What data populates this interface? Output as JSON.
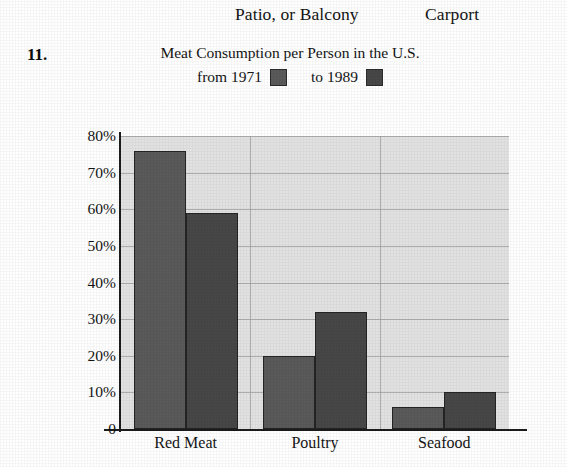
{
  "header": {
    "fragment_left": "Patio, or Balcony",
    "fragment_right": "Carport"
  },
  "problem": {
    "number": "11."
  },
  "chart_data": {
    "type": "bar",
    "title_line1": "Meat Consumption per Person in the U.S.",
    "title_line2_prefix": "from 1971",
    "title_line2_suffix": "to 1989",
    "categories": [
      "Red Meat",
      "Poultry",
      "Seafood"
    ],
    "series": [
      {
        "name": "from 1971",
        "values": [
          76,
          59,
          20
        ],
        "color": "#5a5a5a"
      },
      {
        "name": "to 1989",
        "values": [
          32,
          6,
          10
        ],
        "color": "#474747"
      }
    ],
    "grouped_values": {
      "Red Meat": {
        "1971": 76,
        "1989": 59
      },
      "Poultry": {
        "1971": 20,
        "1989": 32
      },
      "Seafood": {
        "1971": 6,
        "1989": 10
      }
    },
    "ytick_labels": [
      "80%",
      "70%",
      "60%",
      "50%",
      "40%",
      "30%",
      "20%",
      "10%",
      "0"
    ],
    "ytick_values": [
      80,
      70,
      60,
      50,
      40,
      30,
      20,
      10,
      0
    ],
    "ylim": [
      0,
      80
    ],
    "xlabel": "",
    "ylabel": "",
    "grid": true,
    "legend_position": "title-inline",
    "plot_background": "#e2e2e2",
    "series_1971_color": "#5a5a5a",
    "series_1989_color": "#474747"
  }
}
